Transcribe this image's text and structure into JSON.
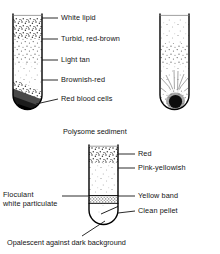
{
  "figure": {
    "title_mid": "Polysome sediment",
    "caption_bottom": "Opalescent against dark background"
  },
  "tube_1": {
    "name": "whole-blood-gradient-tube",
    "labels": [
      {
        "key": "white_lipid",
        "text": "White lipid"
      },
      {
        "key": "turbid",
        "text": "Turbid, red-brown"
      },
      {
        "key": "light_tan",
        "text": "Light tan"
      },
      {
        "key": "brownish_red",
        "text": "Brownish-red"
      },
      {
        "key": "rbc",
        "text": "Red blood cells"
      }
    ]
  },
  "tube_2": {
    "name": "pellet-tube",
    "labels": []
  },
  "tube_3": {
    "name": "polysome-sediment-tube",
    "labels_right": [
      {
        "key": "red",
        "text": "Red"
      },
      {
        "key": "pink_yellowish",
        "text": "Pink-yellowish"
      },
      {
        "key": "yellow_band",
        "text": "Yellow band"
      },
      {
        "key": "clean_pellet",
        "text": "Clean pellet"
      }
    ],
    "labels_left": [
      {
        "key": "floculant",
        "line1": "Floculant",
        "line2": "white particulate"
      }
    ]
  },
  "colors": {
    "ink": "#141414",
    "outline": "#000000",
    "stipple_dark": "#3a3a3a",
    "stipple_light": "#8d8d8d",
    "pellet": "#111111",
    "paper": "#ffffff"
  }
}
